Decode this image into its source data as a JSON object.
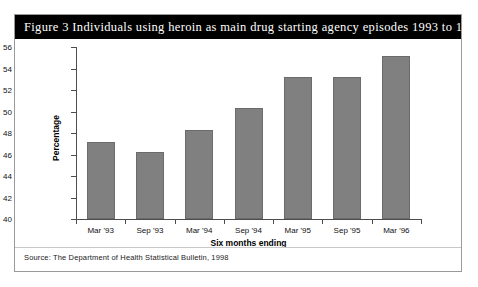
{
  "figure": {
    "title": "Figure 3  Individuals using heroin as main drug starting agency episodes 1993 to 1996",
    "source": "Source: The Department of Health Statistical Bulletin, 1998"
  },
  "chart_data": {
    "type": "bar",
    "title": "Figure 3  Individuals using heroin as main drug starting agency episodes 1993 to 1996",
    "categories": [
      "Mar '93",
      "Sep '93",
      "Mar '94",
      "Sep '94",
      "Mar '95",
      "Sep '95",
      "Mar '96"
    ],
    "values": [
      47.2,
      46.2,
      48.3,
      50.3,
      53.2,
      53.2,
      55.2
    ],
    "xlabel": "Six months ending",
    "ylabel": "Percentage",
    "ylim": [
      40,
      56
    ],
    "ytick_step": 2,
    "yticks": [
      40,
      42,
      44,
      46,
      48,
      50,
      52,
      54,
      56
    ],
    "ytick_labels": [
      "40",
      "42",
      "44",
      "46",
      "48",
      "50",
      "52",
      "54",
      "56"
    ],
    "grid": false,
    "legend": false,
    "bar_color": "#808080",
    "bar_edge_color": "#6b6b6b",
    "axis_color": "#4d4d4d"
  }
}
